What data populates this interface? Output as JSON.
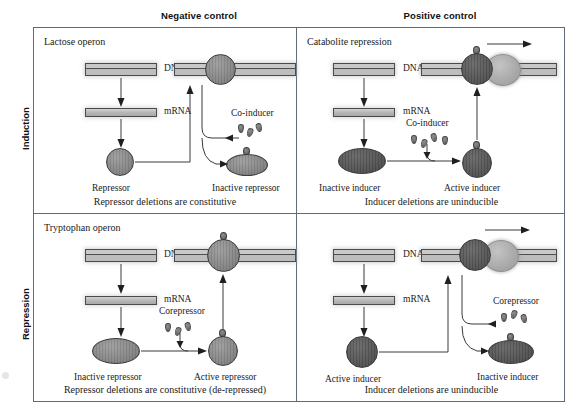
{
  "figure": {
    "columns": [
      {
        "id": "negative",
        "label": "Negative control"
      },
      {
        "id": "positive",
        "label": "Positive control"
      }
    ],
    "rows": [
      {
        "id": "induction",
        "label": "Induction"
      },
      {
        "id": "repression",
        "label": "Repression"
      }
    ]
  },
  "panels": {
    "top_left": {
      "title": "Lactose operon",
      "dna_label": "DNA",
      "mrna_label": "mRNA",
      "regulator_label": "Repressor",
      "effector_label": "Co-inducer",
      "product_label": "Inactive repressor",
      "caption": "Repressor deletions are constitutive"
    },
    "top_right": {
      "title": "Catabolite repression",
      "dna_label": "DNA",
      "mrna_label": "mRNA",
      "regulator_label": "Inactive inducer",
      "effector_label": "Co-inducer",
      "product_label": "Active inducer",
      "caption": "Inducer deletions are uninducible"
    },
    "bottom_left": {
      "title": "Tryptophan operon",
      "dna_label": "DNA",
      "mrna_label": "mRNA",
      "regulator_label": "Inactive repressor",
      "effector_label": "Corepressor",
      "product_label": "Active repressor",
      "caption": "Repressor deletions are constitutive (de-repressed)"
    },
    "bottom_right": {
      "title": "",
      "dna_label": "DNA",
      "mrna_label": "mRNA",
      "regulator_label": "Active inducer",
      "effector_label": "Corepressor",
      "product_label": "Inactive inducer",
      "caption": "Inducer deletions are uninducible"
    }
  },
  "colors": {
    "frame": "#5f6b7a",
    "dna_bar": "#c9c9c9",
    "protein_mid": "#8c8c8c",
    "protein_dark": "#5b5b5b",
    "polymerase": "#a9a9a9",
    "text": "#1a1a1a"
  }
}
